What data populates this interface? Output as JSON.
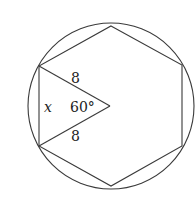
{
  "diagram": {
    "type": "geometry",
    "circle": {
      "cx": 111,
      "cy": 106,
      "r": 83
    },
    "hexagon_vertices": [
      [
        111,
        26
      ],
      [
        182,
        65
      ],
      [
        182,
        146
      ],
      [
        111,
        186
      ],
      [
        39,
        146
      ],
      [
        39,
        66
      ]
    ],
    "center": [
      110,
      106
    ],
    "labels": {
      "side_upper": "8",
      "side_lower": "8",
      "angle": "60°",
      "unknown_side": "x"
    },
    "stroke_color": "#3a3a3a"
  }
}
